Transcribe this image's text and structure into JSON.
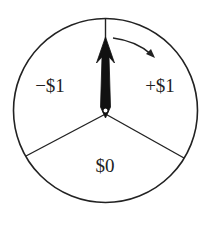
{
  "figure": {
    "type": "spinner",
    "sections": [
      {
        "id": "left",
        "label": "−$1",
        "value": -1
      },
      {
        "id": "right",
        "label": "+$1",
        "value": 1
      },
      {
        "id": "bottom",
        "label": "$0",
        "value": 0
      }
    ],
    "pointer": {
      "direction": "up",
      "rotation": "clockwise"
    },
    "colors": {
      "stroke": "#222222",
      "background": "#ffffff"
    }
  }
}
